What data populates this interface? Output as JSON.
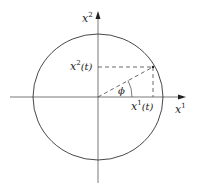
{
  "diagram": {
    "type": "unit-circle-parametrization",
    "axes": {
      "horizontal": {
        "label": "x",
        "superscript": "1"
      },
      "vertical": {
        "label": "x",
        "superscript": "2"
      }
    },
    "point_labels": {
      "x1t": {
        "base": "x",
        "sup": "1",
        "arg": "(t)"
      },
      "x2t": {
        "base": "x",
        "sup": "2",
        "arg": "(t)"
      }
    },
    "angle_label": "ϕ",
    "colors": {
      "stroke": "#333333",
      "background": "#ffffff"
    }
  }
}
